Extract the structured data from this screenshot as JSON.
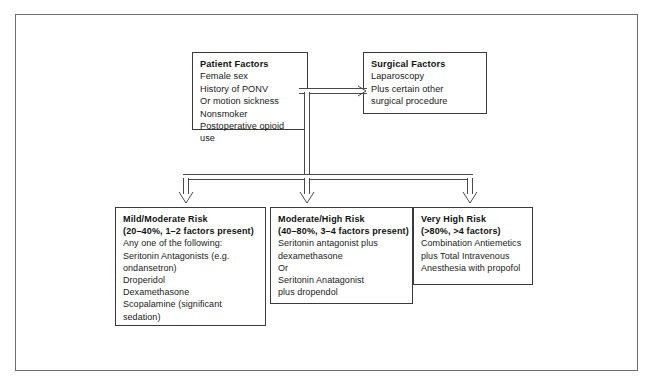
{
  "figure": {
    "type": "flowchart"
  },
  "nodes": {
    "patient_factors": {
      "title": "Patient Factors",
      "lines": [
        "Female sex",
        "History of PONV",
        "Or motion sickness",
        "Nonsmoker",
        "Postoperative opioid use"
      ]
    },
    "surgical_factors": {
      "title": "Surgical Factors",
      "lines": [
        "Laparoscopy",
        "Plus certain other",
        "surgical procedure"
      ]
    },
    "mild_moderate_risk": {
      "title": "Mild/Moderate Risk",
      "subtitle": "(20–40%, 1–2 factors present)",
      "lines": [
        "Any one of the following:",
        "Seritonin Antagonists (e.g.",
        "ondansetron)",
        "Droperidol",
        "Dexamethasone",
        "Scopalamine (significant",
        "sedation)"
      ]
    },
    "moderate_high_risk": {
      "title": "Moderate/High Risk",
      "subtitle": "(40–80%, 3–4 factors present)",
      "lines": [
        "Seritonin antagonist plus",
        "dexamethasone",
        "Or",
        "Seritonin Anatagonist",
        "plus dropendol"
      ]
    },
    "very_high_risk": {
      "title": "Very High Risk",
      "subtitle": "(>80%, >4 factors)",
      "lines": [
        "Combination Antiemetics",
        "plus Total Intravenous",
        "Anesthesia with propofol"
      ]
    }
  },
  "connectors": {
    "patient_to_surgical": "arrow-right",
    "trunk": "arrow-down",
    "branch_left": "arrow-down",
    "branch_middle": "arrow-down",
    "branch_right": "arrow-down"
  },
  "colors": {
    "frame": "#6d6d6d",
    "box_border": "#3a3a3a",
    "connector": "#4a4a4a",
    "text": "#1a1a1a",
    "background": "#ffffff"
  }
}
